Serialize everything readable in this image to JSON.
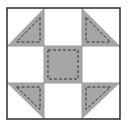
{
  "diagram": {
    "canvas": {
      "width": 140,
      "height": 127
    },
    "colors": {
      "background": "#ffffff",
      "fabric_dark": "#a6a6a6",
      "border": "#2b2b2b",
      "grid_line": "#9a9a9a",
      "stitch": "#333333"
    },
    "block": {
      "x": 7,
      "y": 8,
      "width": 113,
      "height": 111
    },
    "grid": {
      "cols": [
        7,
        44,
        82,
        120
      ],
      "rows": [
        8,
        46,
        83,
        119
      ]
    },
    "pieces": [
      {
        "name": "top-left-half-square-triangle",
        "type": "triangle",
        "cell": [
          0,
          0
        ],
        "shaded_corner": "bottom-right"
      },
      {
        "name": "top-center-square",
        "type": "square",
        "cell": [
          1,
          0
        ],
        "shaded": false
      },
      {
        "name": "top-right-half-square-triangle",
        "type": "triangle",
        "cell": [
          2,
          0
        ],
        "shaded_corner": "bottom-left"
      },
      {
        "name": "middle-left-square",
        "type": "square",
        "cell": [
          0,
          1
        ],
        "shaded": false
      },
      {
        "name": "center-square",
        "type": "square",
        "cell": [
          1,
          1
        ],
        "shaded": true
      },
      {
        "name": "middle-right-square",
        "type": "square",
        "cell": [
          2,
          1
        ],
        "shaded": false
      },
      {
        "name": "bottom-left-half-square-triangle",
        "type": "triangle",
        "cell": [
          0,
          2
        ],
        "shaded_corner": "top-right"
      },
      {
        "name": "bottom-center-square",
        "type": "square",
        "cell": [
          1,
          2
        ],
        "shaded": false
      },
      {
        "name": "bottom-right-half-square-triangle",
        "type": "triangle",
        "cell": [
          2,
          2
        ],
        "shaded_corner": "top-left"
      }
    ],
    "stitch_inset": 4,
    "stitch_dash": "3,2"
  }
}
